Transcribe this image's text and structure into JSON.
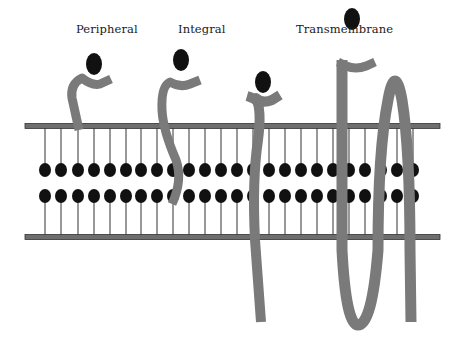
{
  "diagram": {
    "labels": {
      "peripheral": "Peripheral",
      "integral": "Integral",
      "transmembrane": "Transmembrane"
    },
    "colors": {
      "protein": "#7a7a7a",
      "lipid_head": "#111111",
      "membrane_bar": "#6e6e6e",
      "membrane_bar_border": "#333333",
      "tail": "#333333",
      "background": "#ffffff"
    },
    "membrane": {
      "top_bar_y": 126,
      "bottom_bar_y": 237,
      "x_start": 25,
      "x_end": 440,
      "upper_head_y": 170,
      "lower_head_y": 196,
      "lipid_x": [
        45,
        61,
        78,
        94,
        110,
        126,
        141,
        157,
        173,
        189,
        205,
        221,
        237,
        253,
        269,
        285,
        301,
        317,
        333,
        349,
        365,
        381,
        397,
        413
      ]
    },
    "proteins": [
      {
        "name": "peripheral",
        "type": "peripheral"
      },
      {
        "name": "integral",
        "type": "integral"
      },
      {
        "name": "transmembrane-single",
        "type": "transmembrane"
      },
      {
        "name": "transmembrane-multipass",
        "type": "transmembrane"
      }
    ]
  }
}
